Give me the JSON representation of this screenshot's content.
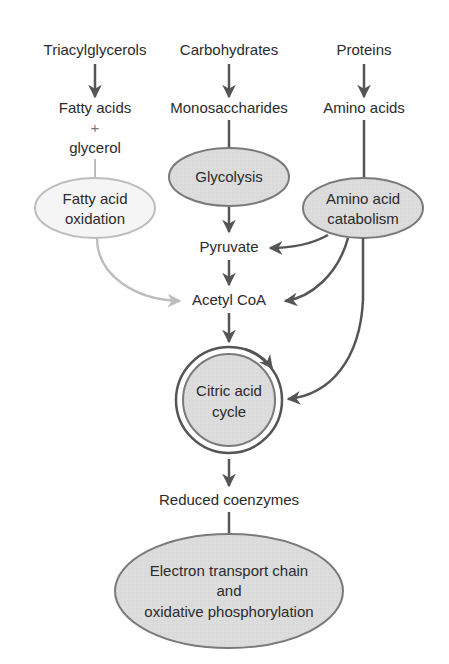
{
  "diagram": {
    "title": "",
    "colors": {
      "line_dark": "#555555",
      "line_light": "#bdbdbd",
      "ellipse_fill_dark": "#d9d9d9",
      "ellipse_fill_light": "#f4f4f4",
      "ellipse_stroke": "#7a7a7a",
      "text": "#2b2b2b"
    },
    "sources": {
      "triacylglycerols": "Triacylglycerols",
      "carbohydrates": "Carbohydrates",
      "proteins": "Proteins"
    },
    "intermediates": {
      "fatty_acids": "Fatty acids",
      "plus": "+",
      "glycerol": "glycerol",
      "monosaccharides": "Monosaccharides",
      "amino_acids": "Amino acids",
      "pyruvate": "Pyruvate",
      "acetyl_coa": "Acetyl CoA",
      "reduced_coenzymes": "Reduced coenzymes"
    },
    "processes": {
      "glycolysis": "Glycolysis",
      "fatty_acid_oxidation": [
        "Fatty acid",
        "oxidation"
      ],
      "amino_acid_catabolism": [
        "Amino acid",
        "catabolism"
      ],
      "citric_acid_cycle": [
        "Citric acid",
        "cycle"
      ],
      "etc": [
        "Electron transport chain",
        "and",
        "oxidative phosphorylation"
      ]
    },
    "edges": [
      {
        "from": "Triacylglycerols",
        "to": "Fatty acids + glycerol"
      },
      {
        "from": "Carbohydrates",
        "to": "Monosaccharides"
      },
      {
        "from": "Proteins",
        "to": "Amino acids"
      },
      {
        "from": "Fatty acids + glycerol",
        "to": "Fatty acid oxidation"
      },
      {
        "from": "Monosaccharides",
        "to": "Glycolysis"
      },
      {
        "from": "Amino acids",
        "to": "Amino acid catabolism"
      },
      {
        "from": "Glycolysis",
        "to": "Pyruvate"
      },
      {
        "from": "Amino acid catabolism",
        "to": "Pyruvate"
      },
      {
        "from": "Pyruvate",
        "to": "Acetyl CoA"
      },
      {
        "from": "Fatty acid oxidation",
        "to": "Acetyl CoA"
      },
      {
        "from": "Amino acid catabolism",
        "to": "Acetyl CoA"
      },
      {
        "from": "Amino acid catabolism",
        "to": "Citric acid cycle"
      },
      {
        "from": "Acetyl CoA",
        "to": "Citric acid cycle"
      },
      {
        "from": "Citric acid cycle",
        "to": "Reduced coenzymes"
      },
      {
        "from": "Reduced coenzymes",
        "to": "Electron transport chain and oxidative phosphorylation"
      }
    ]
  }
}
